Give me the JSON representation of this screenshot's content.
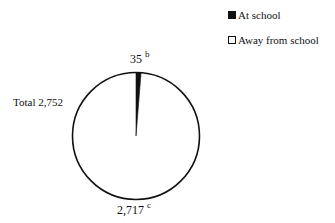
{
  "chart_data": {
    "type": "pie",
    "title": "",
    "total_label": "Total 2,752",
    "total": 2752,
    "categories": [
      "At school",
      "Away from school"
    ],
    "values": [
      35,
      2717
    ],
    "value_labels": [
      "35",
      "2,717"
    ],
    "footnotes": [
      "b",
      "c"
    ],
    "colors": [
      "#111111",
      "#ffffff"
    ],
    "legend_position": "top-right",
    "legend": [
      {
        "label": "At school",
        "style": "filled-square"
      },
      {
        "label": "Away from school",
        "style": "empty-square"
      }
    ]
  },
  "labels": {
    "total": "Total 2,752",
    "small_value": "35",
    "small_note": "b",
    "large_value": "2,717",
    "large_note": "c"
  },
  "legend": {
    "items": [
      {
        "label": "At school"
      },
      {
        "label": "Away from school"
      }
    ]
  }
}
